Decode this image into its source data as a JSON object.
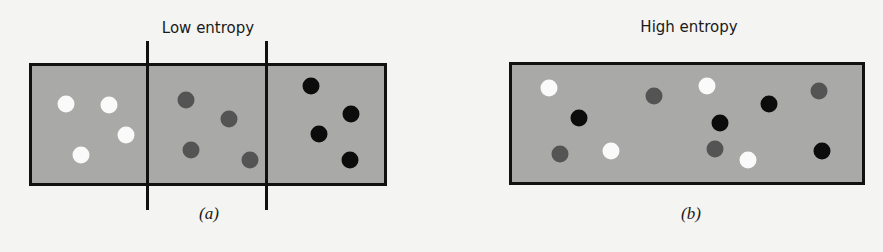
{
  "panels": [
    {
      "id": "a",
      "title": "Low entropy",
      "caption": "(a)",
      "box": {
        "x": 29,
        "y": 63,
        "w": 358,
        "h": 123
      },
      "dividers": [
        {
          "x": 146,
          "y": 41,
          "h": 169
        },
        {
          "x": 265,
          "y": 41,
          "h": 169
        }
      ],
      "dots": [
        {
          "color": "white",
          "x": 66,
          "y": 104
        },
        {
          "color": "white",
          "x": 109,
          "y": 105
        },
        {
          "color": "white",
          "x": 126,
          "y": 135
        },
        {
          "color": "white",
          "x": 81,
          "y": 155
        },
        {
          "color": "gray",
          "x": 186,
          "y": 100
        },
        {
          "color": "gray",
          "x": 229,
          "y": 119
        },
        {
          "color": "gray",
          "x": 191,
          "y": 150
        },
        {
          "color": "gray",
          "x": 250,
          "y": 160
        },
        {
          "color": "black",
          "x": 311,
          "y": 86
        },
        {
          "color": "black",
          "x": 351,
          "y": 114
        },
        {
          "color": "black",
          "x": 319,
          "y": 134
        },
        {
          "color": "black",
          "x": 350,
          "y": 160
        }
      ]
    },
    {
      "id": "b",
      "title": "High entropy",
      "caption": "(b)",
      "box": {
        "x": 509,
        "y": 62,
        "w": 356,
        "h": 123
      },
      "dividers": [],
      "dots": [
        {
          "color": "white",
          "x": 549,
          "y": 88
        },
        {
          "color": "white",
          "x": 611,
          "y": 151
        },
        {
          "color": "white",
          "x": 707,
          "y": 86
        },
        {
          "color": "white",
          "x": 748,
          "y": 160
        },
        {
          "color": "gray",
          "x": 560,
          "y": 154
        },
        {
          "color": "gray",
          "x": 654,
          "y": 96
        },
        {
          "color": "gray",
          "x": 715,
          "y": 149
        },
        {
          "color": "gray",
          "x": 819,
          "y": 91
        },
        {
          "color": "black",
          "x": 579,
          "y": 118
        },
        {
          "color": "black",
          "x": 720,
          "y": 123
        },
        {
          "color": "black",
          "x": 769,
          "y": 104
        },
        {
          "color": "black",
          "x": 822,
          "y": 151
        }
      ]
    }
  ],
  "colors": {
    "background": "#f4f4f2",
    "box_fill": "#a9a9a7",
    "outline": "#111111",
    "dot_white": "#fafafa",
    "dot_gray": "#545454",
    "dot_black": "#0c0c0c"
  }
}
